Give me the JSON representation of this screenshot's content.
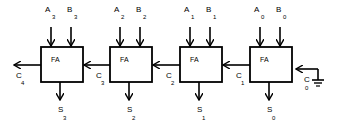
{
  "diagram": {
    "block_label": "FA",
    "adders": [
      {
        "index": 3,
        "a": "A",
        "a_sub": "3",
        "b": "B",
        "b_sub": "3",
        "s": "S",
        "s_sub": "3",
        "cout": "C",
        "cout_sub": "4"
      },
      {
        "index": 2,
        "a": "A",
        "a_sub": "2",
        "b": "B",
        "b_sub": "2",
        "s": "S",
        "s_sub": "2",
        "cout": "C",
        "cout_sub": "3"
      },
      {
        "index": 1,
        "a": "A",
        "a_sub": "1",
        "b": "B",
        "b_sub": "1",
        "s": "S",
        "s_sub": "1",
        "cout": "C",
        "cout_sub": "2"
      },
      {
        "index": 0,
        "a": "A",
        "a_sub": "0",
        "b": "B",
        "b_sub": "0",
        "s": "S",
        "s_sub": "0",
        "cout": "C",
        "cout_sub": "1"
      }
    ],
    "carry_in": {
      "label": "C",
      "sub": "0",
      "connection": "ground-icon"
    }
  }
}
